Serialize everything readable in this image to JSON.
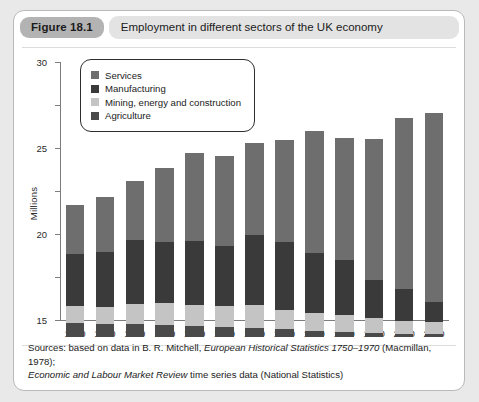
{
  "figure": {
    "badge": "Figure 18.1",
    "title": "Employment in different sectors of the UK economy"
  },
  "sources": {
    "line1_a": "Sources: based on data in B. R. Mitchell, ",
    "line1_b": "European Historical Statistics 1750–1970",
    "line1_c": " (Macmillan, 1978);",
    "line2_a": "Economic and Labour Market Review",
    "line2_b": " time series data (National Statistics)"
  },
  "chart_data": {
    "type": "bar",
    "stacked": true,
    "title": "Employment in different sectors of the UK economy",
    "xlabel": "",
    "ylabel": "Millions",
    "ylim": [
      0,
      30
    ],
    "yticks": [
      0,
      5,
      10,
      15,
      20,
      25,
      30
    ],
    "grid": false,
    "legend_position": "top-left-inside",
    "categories": [
      "1890",
      "1900",
      "1910",
      "1920",
      "1930",
      "1939",
      "1950",
      "1960",
      "1970",
      "1980",
      "1990",
      "2000",
      "2010"
    ],
    "series": [
      {
        "name": "Agriculture",
        "color": "#4a4a4a",
        "values": [
          1.6,
          1.5,
          1.5,
          1.4,
          1.3,
          1.2,
          1.1,
          0.9,
          0.7,
          0.6,
          0.5,
          0.4,
          0.4
        ]
      },
      {
        "name": "Mining, energy and construction",
        "color": "#c4c4c4",
        "values": [
          2.0,
          2.0,
          2.3,
          2.5,
          2.4,
          2.4,
          2.6,
          2.3,
          2.1,
          2.0,
          1.7,
          1.5,
          1.4
        ]
      },
      {
        "name": "Manufacturing",
        "color": "#3a3a3a",
        "values": [
          6.1,
          6.4,
          7.5,
          7.2,
          7.5,
          7.0,
          8.2,
          7.9,
          7.0,
          6.3,
          4.4,
          3.7,
          2.3
        ]
      },
      {
        "name": "Services",
        "color": "#6e6e6e",
        "values": [
          5.7,
          6.4,
          6.9,
          8.6,
          10.2,
          10.4,
          10.7,
          11.8,
          14.2,
          14.2,
          16.4,
          19.9,
          22.0
        ]
      }
    ],
    "totals": [
      15.4,
      16.3,
      18.2,
      19.7,
      21.4,
      21.0,
      22.6,
      22.9,
      24.0,
      23.1,
      23.0,
      25.5,
      26.1
    ]
  },
  "legend": {
    "items": [
      {
        "label": "Services",
        "color": "#6e6e6e"
      },
      {
        "label": "Manufacturing",
        "color": "#3a3a3a"
      },
      {
        "label": "Mining, energy and construction",
        "color": "#c4c4c4"
      },
      {
        "label": "Agriculture",
        "color": "#4a4a4a"
      }
    ]
  }
}
